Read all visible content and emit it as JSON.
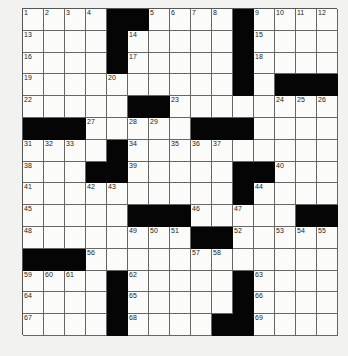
{
  "puzzle": {
    "rows": 15,
    "cols": 15,
    "layout": [
      "....##....#....",
      "....#.....#....",
      "....#.....#....",
      "..........#.###",
      ".....##........",
      "###.....###....",
      "....#..........",
      "...##.....##...",
      "..........#....",
      ".....###.....##",
      "........##.....",
      "###............",
      "....#.....#....",
      "....#.....#....",
      "....#....##...."
    ],
    "numbers": {
      "0,0": "1",
      "0,1": "2",
      "0,2": "3",
      "0,3": "4",
      "0,6": "5",
      "0,7": "6",
      "0,8": "7",
      "0,9": "8",
      "0,11": "9",
      "0,12": "10",
      "0,13": "11",
      "0,14": "12",
      "1,0": "13",
      "1,5": "14",
      "1,11": "15",
      "2,0": "16",
      "2,5": "17",
      "2,11": "18",
      "3,0": "19",
      "3,4": "20",
      "3,10": "21",
      "4,0": "22",
      "4,7": "23",
      "4,12": "24",
      "4,13": "25",
      "4,14": "26",
      "5,3": "27",
      "5,5": "28",
      "5,6": "29",
      "5,10": "30",
      "6,0": "31",
      "6,1": "32",
      "6,2": "33",
      "6,5": "34",
      "6,7": "35",
      "6,8": "36",
      "6,9": "37",
      "7,0": "38",
      "7,5": "39",
      "7,12": "40",
      "8,0": "41",
      "8,3": "42",
      "8,4": "43",
      "8,11": "44",
      "9,0": "45",
      "9,8": "46",
      "9,10": "47",
      "10,0": "48",
      "10,5": "49",
      "10,6": "50",
      "10,7": "51",
      "10,10": "52",
      "10,12": "53",
      "10,13": "54",
      "10,14": "55",
      "11,3": "56",
      "11,8": "57",
      "11,9": "58",
      "12,0": "59",
      "12,1": "60",
      "12,2": "61",
      "12,5": "62",
      "12,11": "63",
      "13,0": "64",
      "13,5": "65",
      "13,11": "66",
      "14,0": "67",
      "14,5": "68",
      "14,11": "69"
    }
  }
}
